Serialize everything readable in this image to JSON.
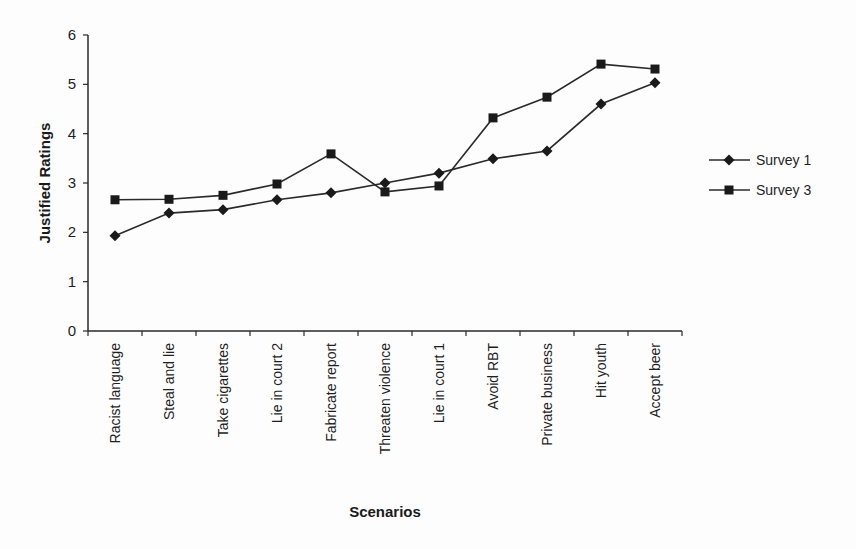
{
  "chart_data": {
    "type": "line",
    "title": "",
    "xlabel": "Scenarios",
    "ylabel": "Justified Ratings",
    "ylim": [
      0,
      6
    ],
    "yticks": [
      "0",
      "1",
      "2",
      "3",
      "4",
      "5",
      "6"
    ],
    "grid": false,
    "legend_position": "right",
    "categories": [
      "Racist language",
      "Steal and lie",
      "Take cigarettes",
      "Lie in court 2",
      "Fabricate report",
      "Threaten violence",
      "Lie in court 1",
      "Avoid RBT",
      "Private business",
      "Hit youth",
      "Accept beer"
    ],
    "series": [
      {
        "name": "Survey 1",
        "marker": "diamond",
        "values": [
          1.93,
          2.39,
          2.46,
          2.66,
          2.8,
          3.0,
          3.2,
          3.49,
          3.65,
          4.6,
          5.03
        ]
      },
      {
        "name": "Survey 3",
        "marker": "square",
        "values": [
          2.66,
          2.67,
          2.75,
          2.98,
          3.59,
          2.82,
          2.94,
          4.32,
          4.74,
          5.41,
          5.31
        ]
      }
    ]
  },
  "colors": {
    "line": "#2a2a2a",
    "marker": "#1a1a1a",
    "axis": "#2a2a2a"
  }
}
